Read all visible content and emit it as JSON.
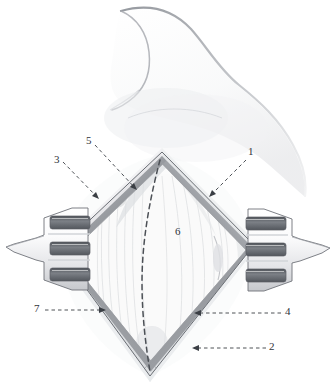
{
  "figure": {
    "type": "medical-illustration",
    "style": "pencil-graphite-drawing",
    "title": "",
    "background_color": "#ffffff",
    "ink_color": "#30343a",
    "shading_colors": {
      "light_graphite": "#e9eaec",
      "mid_graphite": "#b9bbbf",
      "dark_graphite": "#7e8186",
      "edge_graphite": "#5d6166",
      "skin_contour": "#c9ccd0",
      "wound_edge": "#8d9095",
      "muscle_pale": "#f2f3f4"
    }
  },
  "labels": [
    {
      "id": "1",
      "text": "1",
      "x": 248,
      "y": 153,
      "leader": "dashed-arrow-down-left"
    },
    {
      "id": "2",
      "text": "2",
      "x": 269,
      "y": 343,
      "leader": "dashed-arrow-left"
    },
    {
      "id": "3",
      "text": "3",
      "x": 54,
      "y": 155,
      "leader": "dashed-arrow-down-right"
    },
    {
      "id": "4",
      "text": "4",
      "x": 285,
      "y": 308,
      "leader": "dashed-arrow-left"
    },
    {
      "id": "5",
      "text": "5",
      "x": 86,
      "y": 136,
      "leader": "dashed-arrow-down-right"
    },
    {
      "id": "6",
      "text": "6",
      "x": 175,
      "y": 227,
      "leader": "none"
    },
    {
      "id": "7",
      "text": "7",
      "x": 34,
      "y": 305,
      "leader": "dashed-arrow-right"
    }
  ],
  "annotations": {
    "midline_dashed_line": "vertical dashed incision midline",
    "retractor_left": "three-prong self-retaining retractor, left",
    "retractor_right": "three-prong self-retaining retractor, right",
    "incision_shape": "diamond / rhomboid wound opening",
    "prong_count_per_retractor": 3
  }
}
